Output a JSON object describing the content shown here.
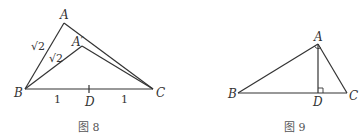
{
  "figure8": {
    "caption": "图 8",
    "labels": {
      "A": "A",
      "A_prime": "A′",
      "B": "B",
      "C": "C",
      "D": "D"
    },
    "side_AB": "√2",
    "side_A_primeB": "√2",
    "seg_BD": "1",
    "seg_DC": "1"
  },
  "figure9": {
    "caption": "图 9",
    "labels": {
      "A": "A",
      "B": "B",
      "C": "C",
      "D": "D"
    }
  }
}
